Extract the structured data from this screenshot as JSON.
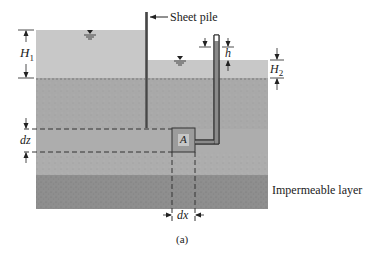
{
  "figure": {
    "caption": "(a)",
    "colors": {
      "water": "#c8c8c8",
      "soil_upper": "#a9a9a9",
      "soil_middle": "#b4b4b4",
      "impermeable": "#8e8e8e",
      "lines": "#333333",
      "background": "#ffffff"
    }
  },
  "labels": {
    "sheet_pile": "Sheet pile",
    "impermeable_layer": "Impermeable layer",
    "H1": "H",
    "H1_sub": "1",
    "H2": "H",
    "H2_sub": "2",
    "h": "h",
    "dz": "dz",
    "dx": "dx",
    "element": "A"
  }
}
